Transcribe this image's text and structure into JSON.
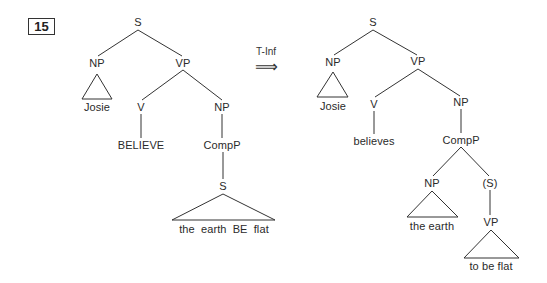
{
  "example": {
    "number": "15"
  },
  "transformation": {
    "label": "T-Inf",
    "arrow": "⟹"
  },
  "left_tree": {
    "root": "S",
    "subject_np": "NP",
    "subject": "Josie",
    "vp": "VP",
    "verb_cat": "V",
    "verb": "BELIEVE",
    "object_np": "NP",
    "compp": "CompP",
    "embedded_s": "S",
    "embedded_string": "the earth BE flat"
  },
  "right_tree": {
    "root": "S",
    "subject_np": "NP",
    "subject": "Josie",
    "vp": "VP",
    "verb_cat": "V",
    "verb": "believes",
    "object_np": "NP",
    "compp": "CompP",
    "embedded_np": "NP",
    "embedded_subject": "the earth",
    "embedded_s": "(S)",
    "embedded_vp": "VP",
    "embedded_predicate": "to be flat"
  }
}
